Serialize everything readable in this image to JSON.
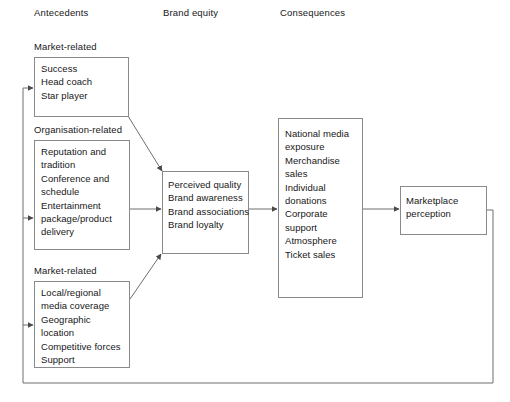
{
  "figure": {
    "background": "#ffffff",
    "line_color": "#6e6e6e",
    "box_border_color": "#8a8a8a",
    "text_color": "#171717"
  },
  "columns": [
    {
      "id": "antecedents",
      "label": "Antecedents"
    },
    {
      "id": "brand-equity",
      "label": "Brand equity"
    },
    {
      "id": "consequences",
      "label": "Consequences"
    }
  ],
  "groups": [
    {
      "id": "market-related-1",
      "label": "Market-related"
    },
    {
      "id": "organisation-related",
      "label": "Organisation-related"
    },
    {
      "id": "market-related-2",
      "label": "Market-related"
    }
  ],
  "nodes": {
    "market_related_top": {
      "title": "Market-related",
      "items": [
        "Success",
        "Head coach",
        "Star player"
      ]
    },
    "organisation_related": {
      "title": "Organisation-related",
      "items": [
        "Reputation and\ntradition",
        "Conference and\nschedule",
        "Entertainment\npackage/product\ndelivery"
      ]
    },
    "market_related_bottom": {
      "title": "Market-related",
      "items": [
        "Local/regional\nmedia coverage",
        "Geographic\nlocation",
        "Competitive forces",
        "Support"
      ]
    },
    "brand_equity": {
      "items": [
        "Perceived quality",
        "Brand awareness",
        "Brand associations",
        "Brand loyalty"
      ]
    },
    "consequences": {
      "items": [
        "National media\nexposure",
        "Merchandise\nsales",
        "Individual\ndonations",
        "Corporate\nsupport",
        "Atmosphere",
        "Ticket sales"
      ]
    },
    "marketplace_perception": {
      "items": [
        "Marketplace\nperception"
      ]
    }
  }
}
